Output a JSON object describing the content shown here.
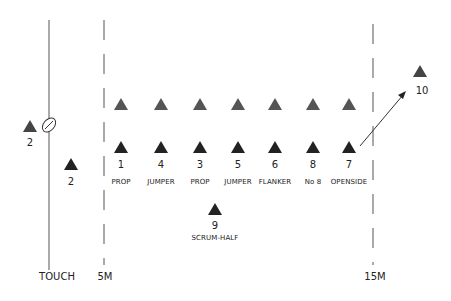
{
  "diagram": {
    "type": "rugby-lineout",
    "colors": {
      "front_row_triangle": "#222222",
      "back_row_triangle": "#555555",
      "line": "#444444"
    },
    "ball": {
      "icon": "rugby-ball-icon"
    },
    "touch_thrower": {
      "number": "2"
    },
    "hooker": {
      "number": "2"
    },
    "opposition_row": {
      "count": 7
    },
    "lineout_players": [
      {
        "number": "1",
        "role": "PROP"
      },
      {
        "number": "4",
        "role": "JUMPER"
      },
      {
        "number": "3",
        "role": "PROP"
      },
      {
        "number": "5",
        "role": "JUMPER"
      },
      {
        "number": "6",
        "role": "FLANKER"
      },
      {
        "number": "8",
        "role": "No 8"
      },
      {
        "number": "7",
        "role": "OPENSIDE"
      }
    ],
    "scrum_half": {
      "number": "9",
      "role": "SCRUM-HALF"
    },
    "fly_half": {
      "number": "10"
    },
    "lines": {
      "touch": "TOUCH",
      "five_metre": "5M",
      "fifteen_metre": "15M"
    }
  }
}
